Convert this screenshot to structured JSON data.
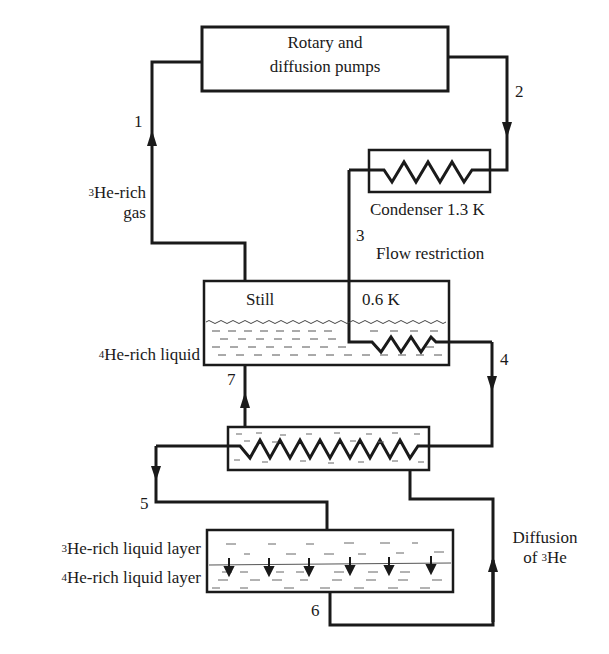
{
  "diagram": {
    "type": "dilution-refrigerator-flow-schematic",
    "components": {
      "pumps": {
        "line1": "Rotary and",
        "line2": "diffusion pumps"
      },
      "condenser": {
        "label": "Condenser 1.3 K"
      },
      "flow_restriction": {
        "label": "Flow restriction"
      },
      "still": {
        "label": "Still",
        "temperature": "0.6 K"
      },
      "heat_exchanger": {
        "label": ""
      },
      "mixing_chamber": {
        "upper_layer_isotope": "3",
        "upper_layer_text": "He-rich liquid layer",
        "lower_layer_isotope": "4",
        "lower_layer_text": "He-rich liquid layer"
      }
    },
    "side_labels": {
      "gas_isotope": "3",
      "gas_line1": "He-rich",
      "gas_line2": "gas",
      "still_liquid_isotope": "4",
      "still_liquid_text": "He-rich liquid",
      "diffusion_line1": "Diffusion",
      "diffusion_line2_prefix": "of ",
      "diffusion_isotope": "3",
      "diffusion_line2_suffix": "He"
    },
    "flow_points": [
      "1",
      "2",
      "3",
      "4",
      "5",
      "6",
      "7"
    ],
    "colors": {
      "ink": "#1a1a1a",
      "background": "#ffffff",
      "liquid_dash": "#555555"
    }
  }
}
